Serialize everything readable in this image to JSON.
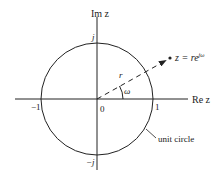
{
  "diagram": {
    "axes": {
      "imag_label": "Im z",
      "real_label": "Re z"
    },
    "ticks": {
      "j": "j",
      "neg_j": "−j",
      "one": "1",
      "neg_one": "−1",
      "origin": "0"
    },
    "vector": {
      "radius_label": "r",
      "angle_label": "ω",
      "point_label": "z = re",
      "point_exponent": "jω"
    },
    "circle_label": "unit circle",
    "colors": {
      "stroke": "#222222",
      "background": "#ffffff"
    }
  }
}
